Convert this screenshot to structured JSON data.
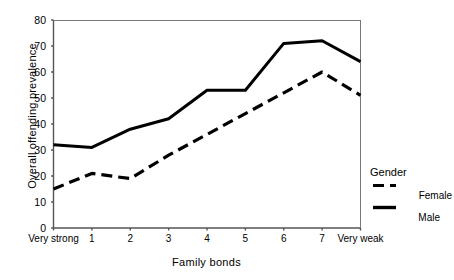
{
  "chart_data": {
    "type": "line",
    "title": "",
    "xlabel": "Family bonds",
    "ylabel": "Overall offending prevalence",
    "categories": [
      "Very strong",
      "1",
      "2",
      "3",
      "4",
      "5",
      "6",
      "7",
      "Very weak"
    ],
    "xticklabels": [
      "Very strong",
      "1",
      "2",
      "3",
      "4",
      "5",
      "6",
      "7",
      "Very weak"
    ],
    "yticklabels": [
      "0",
      "10",
      "20",
      "30",
      "40",
      "50",
      "60",
      "70",
      "80"
    ],
    "ylim": [
      0,
      80
    ],
    "ytick_step": 10,
    "grid": false,
    "legend_position": "right",
    "legend_title": "Gender",
    "series": [
      {
        "name": "Female",
        "style": "dashed",
        "color": "#000000",
        "values": [
          15,
          21,
          19,
          28,
          36,
          44,
          52,
          60,
          51
        ]
      },
      {
        "name": "Male",
        "style": "solid",
        "color": "#000000",
        "values": [
          32,
          31,
          38,
          42,
          53,
          53,
          71,
          72,
          64
        ]
      }
    ]
  },
  "axes": {
    "y_title": "Overall offending prevalence",
    "x_title": "Family bonds"
  },
  "legend": {
    "title": "Gender",
    "entries": [
      {
        "label": "Female",
        "style": "dashed"
      },
      {
        "label": "Male",
        "style": "solid"
      }
    ]
  },
  "colors": {
    "axis": "#555555",
    "line": "#000000",
    "background": "#ffffff"
  }
}
